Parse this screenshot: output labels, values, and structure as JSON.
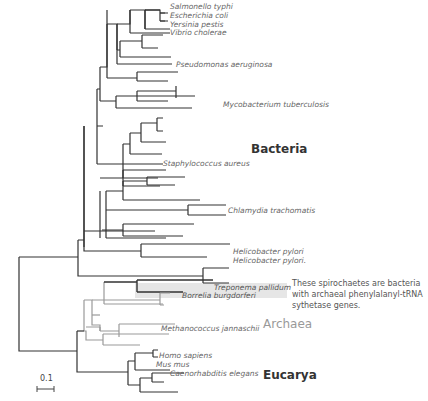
{
  "figure": {
    "type": "phylogenetic-tree"
  },
  "taxa": {
    "salmonella": "Salmonello typhi",
    "ecoli": "Escherichia coli",
    "yersinia": "Yersinia pestis",
    "vibrio": "Vibrio cholerae",
    "pseudomonas": "Pseudomonas aeruginosa",
    "mycobacterium": "Mycobacterium tuberculosis",
    "staph": "Staphylococcus aureus",
    "chlamydia": "Chlamydia trachomatis",
    "helico1": "Helicobacter pylori",
    "helico2": "Helicobacter pylori.",
    "treponema": "Treponema pallidum",
    "borrelia": "Borrelia burgdorferi",
    "methanococcus": "Methanococcus jannaschii",
    "homo": "Homo sapiens",
    "mus": "Mus mus",
    "caeno": "Caenorhabditis elegans"
  },
  "groups": {
    "bacteria": "Bacteria",
    "archaea": "Archaea",
    "eucarya": "Eucarya"
  },
  "annotation": {
    "spirochete_note": "These spirochaetes are bacteria with archaeal phenylalanyl-tRNA sythetase genes."
  },
  "scale_bar": {
    "label": "0.1"
  },
  "colors": {
    "bacteria_branch": "#333333",
    "archaea_branch": "#999999",
    "eucarya_branch": "#333333",
    "highlight": "#e4e4e4"
  }
}
